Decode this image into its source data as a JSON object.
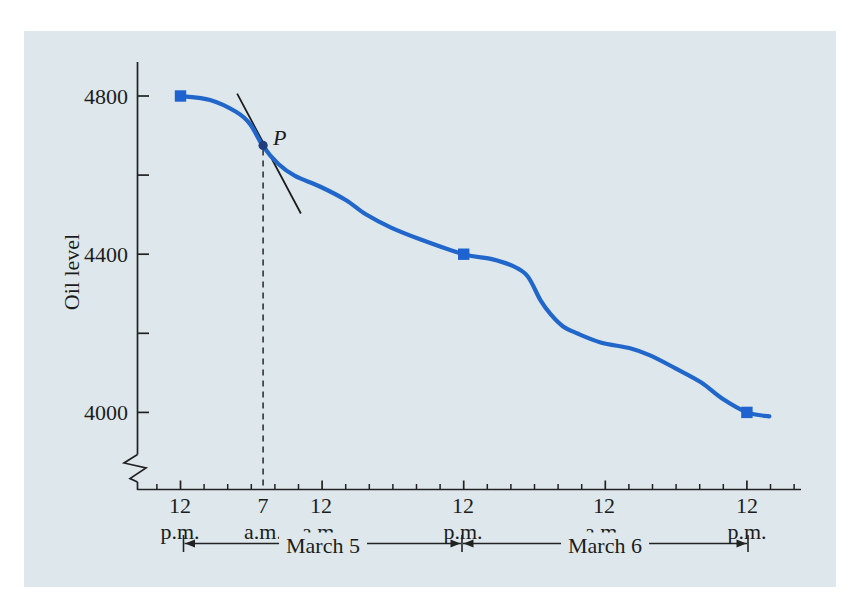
{
  "figure": {
    "panel_color": "#dee8ec",
    "curve_color": "#2166cb",
    "marker_color": "#1e63cf",
    "point_color": "#223d7f",
    "axis_color": "#222222",
    "tangent_color": "#1b1b1b",
    "dashed_color": "#333333",
    "text_color": "#1c1c1c"
  },
  "chart_data": {
    "type": "line",
    "title": "",
    "xlabel": "",
    "ylabel": "Oil level",
    "x_unit": "hours after first tick (12 p.m.)",
    "x_tick_labels": [
      {
        "hour": 0,
        "time": "12",
        "period": "p.m."
      },
      {
        "hour": 7,
        "time": "7",
        "period": "a.m."
      },
      {
        "hour": 12,
        "time": "12",
        "period": "a.m."
      },
      {
        "hour": 24,
        "time": "12",
        "period": "p.m."
      },
      {
        "hour": 36,
        "time": "12",
        "period": "a.m."
      },
      {
        "hour": 48,
        "time": "12",
        "period": "p.m."
      }
    ],
    "x_major_tick_hours": [
      0,
      12,
      24,
      36,
      48
    ],
    "x_minor_tick_step_hours": 2,
    "x_minor_tick_range_hours": [
      -2,
      52
    ],
    "y_tick_values": [
      4000,
      4200,
      4400,
      4600,
      4800
    ],
    "y_labeled_ticks": [
      "4800",
      "4400",
      "4000"
    ],
    "ylim": [
      3960,
      4880
    ],
    "y_axis_break": true,
    "grid": false,
    "legend": false,
    "series": [
      {
        "name": "oil level",
        "points": [
          [
            0,
            4800
          ],
          [
            2.5,
            4790
          ],
          [
            4.7,
            4760
          ],
          [
            5.9,
            4729
          ],
          [
            7,
            4673
          ],
          [
            8.3,
            4628
          ],
          [
            9.7,
            4598
          ],
          [
            11.9,
            4570
          ],
          [
            14,
            4537
          ],
          [
            15.7,
            4501
          ],
          [
            17.8,
            4468
          ],
          [
            20.3,
            4438
          ],
          [
            24,
            4400
          ],
          [
            26.3,
            4388
          ],
          [
            28.1,
            4371
          ],
          [
            29.4,
            4345
          ],
          [
            30.5,
            4284
          ],
          [
            31.4,
            4247
          ],
          [
            32.4,
            4218
          ],
          [
            33.6,
            4200
          ],
          [
            35.6,
            4177
          ],
          [
            38.1,
            4162
          ],
          [
            39.8,
            4144
          ],
          [
            41.9,
            4112
          ],
          [
            44.1,
            4076
          ],
          [
            45.9,
            4035
          ],
          [
            48,
            4000
          ],
          [
            49.9,
            3990
          ]
        ]
      }
    ],
    "markers": [
      {
        "hour": 0,
        "level": 4800
      },
      {
        "hour": 24,
        "level": 4400
      },
      {
        "hour": 48,
        "level": 4000
      }
    ],
    "point_P": {
      "hour": 7,
      "level": 4675,
      "label": "P"
    },
    "tangent_at_P": {
      "from": [
        4.8,
        4806
      ],
      "to": [
        10.2,
        4503
      ]
    },
    "dashed_drop_line": {
      "hour": 7,
      "from_level": 4675
    },
    "date_spans": [
      {
        "label": "March 5",
        "from_hour": 0,
        "to_hour": 24
      },
      {
        "label": "March 6",
        "from_hour": 24,
        "to_hour": 48
      }
    ]
  }
}
